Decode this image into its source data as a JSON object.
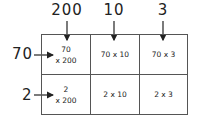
{
  "columns": [
    {
      "label": "200",
      "x": 65
    },
    {
      "label": "10",
      "x": 114
    },
    {
      "label": "3",
      "x": 162
    }
  ],
  "rows": [
    {
      "label": "70",
      "y": 55
    },
    {
      "label": "2",
      "y": 95
    }
  ],
  "cells": [
    [
      {
        "line1": "70",
        "line2": "x 200"
      },
      {
        "line1": "70 x 10",
        "line2": ""
      },
      {
        "line1": "70 x 3",
        "line2": ""
      }
    ],
    [
      {
        "line1": "2",
        "line2": "x 200"
      },
      {
        "line1": "2 x 10",
        "line2": ""
      },
      {
        "line1": "2 x 3",
        "line2": ""
      }
    ]
  ]
}
